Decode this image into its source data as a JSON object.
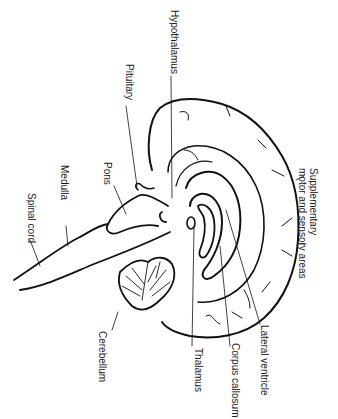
{
  "diagram": {
    "orientation": "rotated 90 degrees clockwise",
    "labels": {
      "hypothalamus": "Hypothalamus",
      "pituitary": "Pituitary",
      "pons": "Pons",
      "medulla": "Medulla",
      "spinal_cord": "Spinal cord",
      "cerebellum": "Cerebellum",
      "thalamus": "Thalamus",
      "corpus_callosum": "Corpus callosum",
      "lateral_ventricle": "Lateral ventricle",
      "supplementary_line1": "Supplementary",
      "supplementary_line2": "motor and sensory areas"
    },
    "colors": {
      "line": "#111111",
      "text": "#1a1a1a",
      "background": "#ffffff"
    }
  }
}
